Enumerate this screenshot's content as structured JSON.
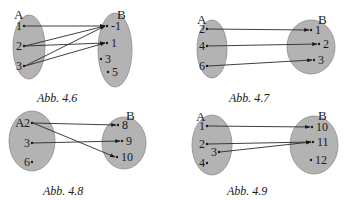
{
  "diagrams": [
    {
      "id": "4.6",
      "caption": "Abb. 4.6",
      "set_a": {
        "label": "A",
        "ellipse": {
          "cx": 29,
          "cy": 47,
          "rx": 16,
          "ry": 32
        },
        "label_pos": {
          "x": 14,
          "y": 19
        },
        "elements": [
          {
            "label": "1",
            "x": 16,
            "y": 30,
            "dx": 7
          },
          {
            "label": "2",
            "x": 16,
            "y": 50,
            "dx": 7
          },
          {
            "label": "3",
            "x": 16,
            "y": 70,
            "dx": 7
          }
        ]
      },
      "set_b": {
        "label": "B",
        "ellipse": {
          "cx": 115,
          "cy": 50,
          "rx": 17,
          "ry": 37
        },
        "label_pos": {
          "x": 117,
          "y": 19
        },
        "elements": [
          {
            "label": "-1",
            "x": 110,
            "y": 30,
            "dx": -4
          },
          {
            "label": "1",
            "x": 110,
            "y": 47,
            "dx": -4
          },
          {
            "label": "3",
            "x": 104,
            "y": 63,
            "dx": -2
          },
          {
            "label": "5",
            "x": 111,
            "y": 76,
            "dx": -2
          }
        ]
      },
      "arrows": [
        {
          "from": 0,
          "to": 0
        },
        {
          "from": 1,
          "to": 0
        },
        {
          "from": 1,
          "to": 1
        },
        {
          "from": 2,
          "to": 0
        },
        {
          "from": 2,
          "to": 1
        }
      ]
    },
    {
      "id": "4.7",
      "caption": "Abb. 4.7",
      "set_a": {
        "label": "A",
        "ellipse": {
          "cx": 212,
          "cy": 49,
          "rx": 15,
          "ry": 29
        },
        "label_pos": {
          "x": 197,
          "y": 24
        },
        "elements": [
          {
            "label": "2",
            "x": 199,
            "y": 33,
            "dx": 7
          },
          {
            "label": "4",
            "x": 199,
            "y": 50,
            "dx": 7
          },
          {
            "label": "6",
            "x": 199,
            "y": 70,
            "dx": 7
          }
        ]
      },
      "set_b": {
        "label": "B",
        "ellipse": {
          "cx": 311,
          "cy": 47,
          "rx": 24,
          "ry": 27
        },
        "label_pos": {
          "x": 318,
          "y": 24
        },
        "elements": [
          {
            "label": "1",
            "x": 314,
            "y": 34,
            "dx": -4
          },
          {
            "label": "2",
            "x": 322,
            "y": 48,
            "dx": -4
          },
          {
            "label": "3",
            "x": 317,
            "y": 64,
            "dx": -4
          }
        ]
      },
      "arrows": [
        {
          "from": 0,
          "to": 0
        },
        {
          "from": 1,
          "to": 1
        },
        {
          "from": 2,
          "to": 2
        }
      ]
    },
    {
      "id": "4.8",
      "caption": "Abb. 4.8",
      "set_a": {
        "label": "A",
        "ellipse": {
          "cx": 32,
          "cy": 141,
          "rx": 23,
          "ry": 30
        },
        "label_pos": {
          "x": 15,
          "y": 127
        },
        "elements": [
          {
            "label": "2",
            "x": 24,
            "y": 127,
            "dx": 7
          },
          {
            "label": "3",
            "x": 24,
            "y": 147,
            "dx": 7
          },
          {
            "label": "6",
            "x": 24,
            "y": 166,
            "dx": 7
          }
        ]
      },
      "set_b": {
        "label": "B",
        "ellipse": {
          "cx": 124,
          "cy": 143,
          "rx": 22,
          "ry": 26
        },
        "label_pos": {
          "x": 126,
          "y": 120
        },
        "elements": [
          {
            "label": "8",
            "x": 121,
            "y": 129,
            "dx": -4
          },
          {
            "label": "9",
            "x": 125,
            "y": 145,
            "dx": -4
          },
          {
            "label": "10",
            "x": 120,
            "y": 161,
            "dx": -4
          }
        ]
      },
      "arrows": [
        {
          "from": 0,
          "to": 0
        },
        {
          "from": 0,
          "to": 2
        },
        {
          "from": 1,
          "to": 1
        }
      ]
    },
    {
      "id": "4.9",
      "caption": "Abb. 4.9",
      "set_a": {
        "label": "A",
        "ellipse": {
          "cx": 212,
          "cy": 145,
          "rx": 20,
          "ry": 30
        },
        "label_pos": {
          "x": 196,
          "y": 121
        },
        "elements": [
          {
            "label": "1",
            "x": 199,
            "y": 130,
            "dx": 7
          },
          {
            "label": "2",
            "x": 199,
            "y": 148,
            "dx": 7
          },
          {
            "label": "3",
            "x": 211,
            "y": 156,
            "dx": 7
          },
          {
            "label": "4",
            "x": 199,
            "y": 167,
            "dx": 7
          }
        ]
      },
      "set_b": {
        "label": "B",
        "ellipse": {
          "cx": 314,
          "cy": 145,
          "rx": 24,
          "ry": 29
        },
        "label_pos": {
          "x": 318,
          "y": 120
        },
        "elements": [
          {
            "label": "10",
            "x": 315,
            "y": 131,
            "dx": -4
          },
          {
            "label": "11",
            "x": 316,
            "y": 146,
            "dx": -4
          },
          {
            "label": "12",
            "x": 314,
            "y": 164,
            "dx": -4
          }
        ]
      },
      "arrows": [
        {
          "from": 0,
          "to": 0
        },
        {
          "from": 1,
          "to": 1
        },
        {
          "from": 2,
          "to": 1
        }
      ]
    }
  ],
  "captions_pos": [
    {
      "x": 37,
      "y": 102
    },
    {
      "x": 229,
      "y": 102
    },
    {
      "x": 43,
      "y": 195
    },
    {
      "x": 227,
      "y": 195
    }
  ],
  "colors": {
    "ellipse_fill": "#b3b3b3",
    "ellipse_stroke": "#8c8c8c",
    "ink": "#1a1a1a"
  }
}
